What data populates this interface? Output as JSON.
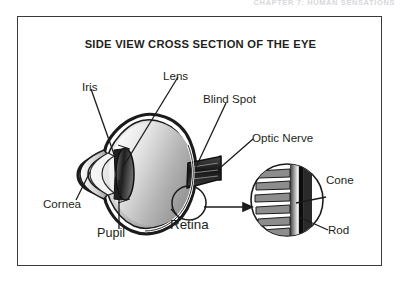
{
  "page": {
    "background_color": "#ffffff",
    "cutoff_header_text": "CHAPTER 7: HUMAN SENSATIONS"
  },
  "figure": {
    "title": "SIDE VIEW CROSS SECTION OF THE EYE",
    "frame_color": "#3a3a3c",
    "ink_color": "#231f20",
    "labels": [
      {
        "id": "iris",
        "text": "Iris",
        "x": 81,
        "y": 80
      },
      {
        "id": "lens",
        "text": "Lens",
        "x": 162,
        "y": 69
      },
      {
        "id": "blind-spot",
        "text": "Blind Spot",
        "x": 202,
        "y": 92
      },
      {
        "id": "optic-nerve",
        "text": "Optic Nerve",
        "x": 251,
        "y": 131
      },
      {
        "id": "cone",
        "text": "Cone",
        "x": 325,
        "y": 173
      },
      {
        "id": "cornea",
        "text": "Cornea",
        "x": 42,
        "y": 197
      },
      {
        "id": "retina",
        "text": "Retina",
        "x": 169,
        "y": 218
      },
      {
        "id": "rod",
        "text": "Rod",
        "x": 327,
        "y": 223
      },
      {
        "id": "pupil",
        "text": "Pupil",
        "x": 96,
        "y": 226
      }
    ],
    "eye": {
      "center_x": 133,
      "center_y": 156,
      "radius_x": 50,
      "radius_y": 58,
      "vitreous_gradient": [
        "#fefefe",
        "#b9b9b9",
        "#8c8c8c"
      ]
    },
    "magnifier": {
      "center_x": 286,
      "center_y": 199,
      "radius": 36,
      "source_circle": {
        "center_x": 188,
        "center_y": 185,
        "radius": 17
      },
      "photoreceptor_count": 6
    }
  }
}
